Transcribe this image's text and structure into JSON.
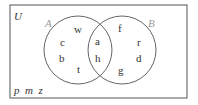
{
  "universe": {
    "label": "U",
    "outside": [
      "p",
      "m",
      "z"
    ],
    "outside_text": "p  m  z"
  },
  "sets": [
    {
      "label": "A",
      "only": [
        "w",
        "c",
        "b",
        "t"
      ]
    },
    {
      "label": "B",
      "only": [
        "f",
        "r",
        "d",
        "g"
      ]
    }
  ],
  "intersection": [
    "a",
    "h"
  ],
  "elements": {
    "w": "w",
    "c": "c",
    "b": "b",
    "t": "t",
    "a": "a",
    "h": "h",
    "f": "f",
    "r": "r",
    "d": "d",
    "g": "g"
  },
  "colors": {
    "stroke": "#555555",
    "text": "#333333",
    "set_label": "#999999"
  }
}
